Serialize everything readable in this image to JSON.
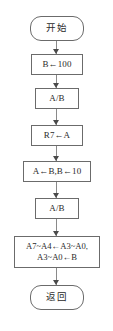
{
  "diagram": {
    "nodes": [
      {
        "id": "start",
        "type": "terminator",
        "label": "开始"
      },
      {
        "id": "n1",
        "type": "process",
        "label": "B←100"
      },
      {
        "id": "n2",
        "type": "process",
        "label": "A/B"
      },
      {
        "id": "n3",
        "type": "process",
        "label": "R7←A"
      },
      {
        "id": "n4",
        "type": "process",
        "label": "A←B,B←10"
      },
      {
        "id": "n5",
        "type": "process",
        "label": "A/B"
      },
      {
        "id": "n6",
        "type": "process",
        "label_line1": "A7~A4←A3~A0,",
        "label_line2": "A3~A0←B"
      },
      {
        "id": "end",
        "type": "terminator",
        "label": "返回"
      }
    ],
    "edges": [
      {
        "from": "start",
        "to": "n1",
        "arrow": "down"
      },
      {
        "from": "n1",
        "to": "n2",
        "arrow": "down"
      },
      {
        "from": "n2",
        "to": "n3",
        "arrow": "down"
      },
      {
        "from": "n3",
        "to": "n4",
        "arrow": "down"
      },
      {
        "from": "n4",
        "to": "n5",
        "arrow": "down"
      },
      {
        "from": "n5",
        "to": "n6",
        "arrow": "down"
      },
      {
        "from": "n6",
        "to": "end",
        "arrow": "down"
      }
    ],
    "colors": {
      "background": "#ffffff",
      "node_border": "#6b6b6b",
      "node_fill": "#ffffff",
      "text": "#2a2a2a",
      "connector": "#8a8a8a",
      "arrowhead": "#4a4a4a"
    }
  }
}
